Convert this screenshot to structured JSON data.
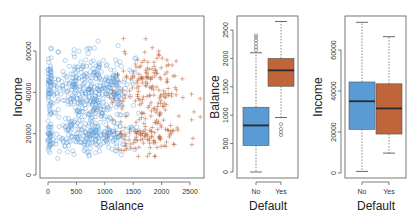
{
  "chart_data": [
    {
      "type": "scatter",
      "title": "",
      "xlabel": "Balance",
      "ylabel": "Income",
      "xlim": [
        -50,
        2750
      ],
      "ylim": [
        -1500,
        76000
      ],
      "xticks": [
        0,
        500,
        1000,
        1500,
        2000,
        2500
      ],
      "yticks": [
        0,
        20000,
        40000,
        60000
      ],
      "grid": false,
      "legend": null,
      "series": [
        {
          "name": "No",
          "marker": "circle",
          "color": "#5b9bd5",
          "approx_count": 700,
          "balance_range": [
            0,
            1500
          ],
          "income_range": [
            5000,
            70000
          ]
        },
        {
          "name": "Yes",
          "marker": "plus",
          "color": "#c0643a",
          "approx_count": 280,
          "balance_range": [
            1000,
            2700
          ],
          "income_range": [
            9000,
            66000
          ]
        }
      ]
    },
    {
      "type": "box",
      "title": "",
      "xlabel": "Default",
      "ylabel": "Balance",
      "categories": [
        "No",
        "Yes"
      ],
      "ylim": [
        -100,
        2750
      ],
      "yticks": [
        0,
        500,
        1000,
        1500,
        2000,
        2500
      ],
      "boxes": [
        {
          "name": "No",
          "color": "#5b9bd5",
          "min": 0,
          "q1": 465,
          "median": 820,
          "q3": 1140,
          "max": 2100,
          "outliers": [
            2150,
            2200,
            2260,
            2320,
            2370,
            2400
          ]
        },
        {
          "name": "Yes",
          "color": "#c0643a",
          "min": 960,
          "q1": 1510,
          "median": 1790,
          "q3": 2000,
          "max": 2650,
          "outliers": [
            650,
            700,
            760,
            840
          ]
        }
      ]
    },
    {
      "type": "box",
      "title": "",
      "xlabel": "Default",
      "ylabel": "Income",
      "categories": [
        "No",
        "Yes"
      ],
      "ylim": [
        -1500,
        76000
      ],
      "yticks": [
        0,
        20000,
        40000,
        60000
      ],
      "boxes": [
        {
          "name": "No",
          "color": "#5b9bd5",
          "min": 770,
          "q1": 21300,
          "median": 35000,
          "q3": 44400,
          "max": 73500,
          "outliers": []
        },
        {
          "name": "Yes",
          "color": "#c0643a",
          "min": 9700,
          "q1": 19000,
          "median": 31500,
          "q3": 43500,
          "max": 66500,
          "outliers": []
        }
      ]
    }
  ],
  "labels": {
    "scatter_x": "Balance",
    "scatter_y": "Income",
    "box1_x": "Default",
    "box1_y": "Balance",
    "box2_x": "Default",
    "box2_y": "Income"
  }
}
